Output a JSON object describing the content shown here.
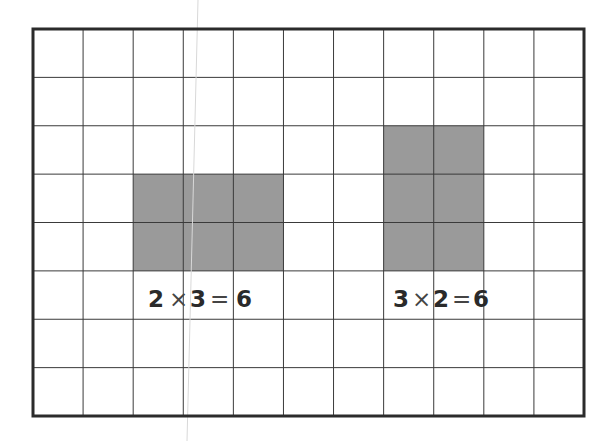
{
  "diagram": {
    "grid": {
      "columns": 11,
      "rows": 8,
      "left": 33,
      "top": 29,
      "right": 584,
      "bottom": 416,
      "line_color": "#3a3a3a",
      "border_color": "#2b2b2b",
      "background": "#ffffff"
    },
    "shade_color": "#9a9a9a",
    "arrays": [
      {
        "name": "2x3-array",
        "rows": 2,
        "cols": 3,
        "start_col": 2,
        "start_row": 3
      },
      {
        "name": "3x2-array",
        "rows": 3,
        "cols": 2,
        "start_col": 7,
        "start_row": 2
      }
    ],
    "equations": [
      {
        "name": "equation-2x3",
        "tokens": [
          {
            "text": "2",
            "x": 148
          },
          {
            "text": "×",
            "x": 169
          },
          {
            "text": "3",
            "x": 190
          },
          {
            "text": "=",
            "x": 210
          },
          {
            "text": "6",
            "x": 236
          }
        ],
        "full_text": "2 × 3 = 6",
        "top": 288
      },
      {
        "name": "equation-3x2",
        "tokens": [
          {
            "text": "3",
            "x": 393
          },
          {
            "text": "×",
            "x": 412
          },
          {
            "text": "2",
            "x": 433
          },
          {
            "text": "=",
            "x": 452
          },
          {
            "text": "6",
            "x": 473
          }
        ],
        "full_text": "3 × 2 = 6",
        "top": 288
      }
    ]
  }
}
